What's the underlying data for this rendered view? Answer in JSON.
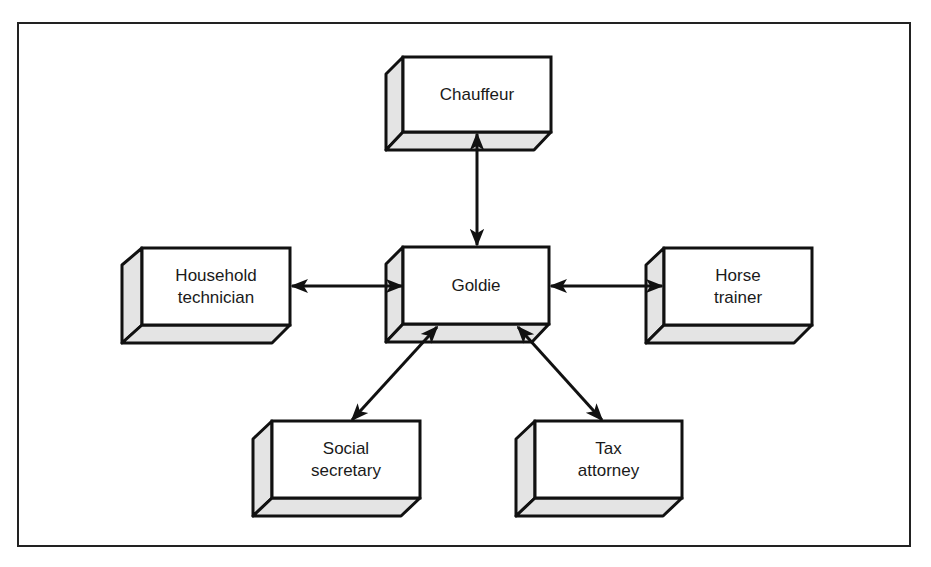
{
  "diagram": {
    "type": "hub-and-spoke",
    "center": {
      "id": "goldie",
      "label": "Goldie"
    },
    "nodes": [
      {
        "id": "chauffeur",
        "label": "Chauffeur"
      },
      {
        "id": "goldie",
        "label": "Goldie"
      },
      {
        "id": "household",
        "label": "Household\ntechnician"
      },
      {
        "id": "horse",
        "label": "Horse\ntrainer"
      },
      {
        "id": "social",
        "label": "Social\nsecretary"
      },
      {
        "id": "tax",
        "label": "Tax\nattorney"
      }
    ],
    "edges": [
      {
        "from": "goldie",
        "to": "chauffeur",
        "direction": "bidirectional"
      },
      {
        "from": "goldie",
        "to": "household",
        "direction": "bidirectional"
      },
      {
        "from": "goldie",
        "to": "horse",
        "direction": "bidirectional"
      },
      {
        "from": "goldie",
        "to": "social",
        "direction": "bidirectional"
      },
      {
        "from": "goldie",
        "to": "tax",
        "direction": "bidirectional"
      }
    ],
    "colors": {
      "line": "#111111",
      "box_face": "#ffffff",
      "box_side": "#e6e6e6",
      "frame": "#222222"
    }
  }
}
